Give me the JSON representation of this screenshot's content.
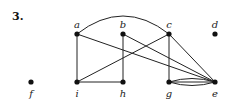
{
  "problem_number": "3.",
  "graph": {
    "directed": false,
    "vertices": [
      "a",
      "b",
      "c",
      "d",
      "e",
      "f",
      "g",
      "h",
      "i"
    ],
    "edges": [
      {
        "from": "a",
        "to": "c",
        "style": "arc"
      },
      {
        "from": "a",
        "to": "i",
        "style": "straight"
      },
      {
        "from": "a",
        "to": "e",
        "style": "straight"
      },
      {
        "from": "b",
        "to": "h",
        "style": "straight"
      },
      {
        "from": "b",
        "to": "e",
        "style": "straight"
      },
      {
        "from": "c",
        "to": "i",
        "style": "straight"
      },
      {
        "from": "c",
        "to": "g",
        "style": "straight"
      },
      {
        "from": "c",
        "to": "e",
        "style": "straight"
      },
      {
        "from": "i",
        "to": "h",
        "style": "straight"
      },
      {
        "from": "g",
        "to": "e",
        "style": "straight"
      },
      {
        "from": "g",
        "to": "e",
        "style": "curve-up"
      },
      {
        "from": "g",
        "to": "e",
        "style": "curve-down"
      }
    ],
    "isolated_vertices": [
      "d",
      "f"
    ]
  }
}
